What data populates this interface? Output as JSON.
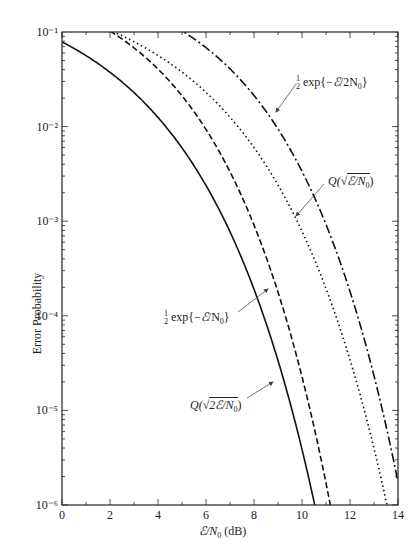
{
  "chart_data": {
    "type": "line",
    "title": "",
    "xlabel": "ℰ/N₀ (dB)",
    "ylabel": "Error Probability",
    "xlim": [
      0,
      14
    ],
    "ylim": [
      1e-06,
      0.1
    ],
    "yscale": "log",
    "grid": false,
    "x_ticks": [
      0,
      2,
      4,
      6,
      8,
      10,
      12,
      14
    ],
    "y_ticks": [
      "10⁻⁶",
      "10⁻⁵",
      "10⁻⁴",
      "10⁻³",
      "10⁻²",
      "10⁻¹"
    ],
    "x": [
      0,
      1,
      2,
      3,
      4,
      5,
      6,
      7,
      8,
      9,
      10,
      11,
      12,
      13,
      14
    ],
    "series": [
      {
        "name": "Q(√(2ℰ/N₀))",
        "style": "solid",
        "values": [
          0.0786,
          0.0563,
          0.0375,
          0.0229,
          0.0125,
          0.00595,
          0.00239,
          0.000773,
          0.000191,
          3.36e-05,
          3.87e-06,
          2.61e-07,
          null,
          null,
          null
        ]
      },
      {
        "name": "½ exp{−ℰ/N₀}",
        "style": "dashed",
        "values": [
          0.184,
          0.142,
          0.103,
          0.0684,
          0.0406,
          0.0211,
          0.00929,
          0.00334,
          0.00092,
          0.000181,
          2.27e-05,
          1.6e-06,
          null,
          null,
          null
        ]
      },
      {
        "name": "Q(√(ℰ/N₀))",
        "style": "dotted",
        "values": [
          0.159,
          0.13,
          0.104,
          0.0789,
          0.0565,
          0.0377,
          0.023,
          0.0126,
          0.006,
          0.00242,
          0.000783,
          0.000194,
          3.43e-05,
          3.97e-06,
          2.7e-07
        ]
      },
      {
        "name": "½ exp{−ℰ/2N₀}",
        "style": "dash-dot",
        "values": [
          0.303,
          0.266,
          0.226,
          0.184,
          0.143,
          0.103,
          0.0684,
          0.0407,
          0.0212,
          0.00931,
          0.00337,
          0.00093,
          0.000183,
          2.3e-05,
          1.6e-06
        ]
      }
    ],
    "annotations": [
      {
        "text": "½ exp{−ℰ/2N₀}",
        "series": 3
      },
      {
        "text": "Q(√(ℰ/N₀))",
        "series": 2
      },
      {
        "text": "½ exp{−ℰ/N₀}",
        "series": 1
      },
      {
        "text": "Q(√(2ℰ/N₀))",
        "series": 0
      }
    ]
  },
  "labels": {
    "ann_halfexp2": {
      "pre": "exp{−",
      "post": "/2N",
      "sub": "0",
      "close": "}"
    },
    "ann_q1": {
      "pre": "Q(",
      "rad": "ℰ/N",
      "sub": "0",
      "close": ")"
    },
    "ann_halfexp1": {
      "pre": "exp{−",
      "post": "/N",
      "sub": "0",
      "close": "}"
    },
    "ann_q2": {
      "pre": "Q(",
      "rad": "2ℰ/N",
      "sub": "0",
      "close": ")"
    },
    "xlabel": {
      "main": "ℰ/N",
      "sub": "0",
      "unit": " (dB)"
    },
    "ylabel": "Error Probability"
  }
}
